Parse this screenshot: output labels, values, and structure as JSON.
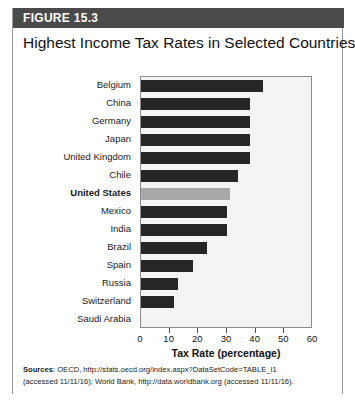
{
  "figure": {
    "label": "FIGURE 15.3",
    "title": "Highest Income Tax Rates in Selected Countries",
    "header_bg": "#4a4a4a",
    "bar_color": "#262626",
    "highlight_color": "#a8a8a8"
  },
  "source": {
    "lead": "Sources",
    "line1": ": OECD, http://stats.oecd.org/index.aspx?DataSetCode=TABLE_I1",
    "line2": "(accessed 11/11/16); World Bank, http://data.worldbank.org (accessed 11/11/16)."
  },
  "chart_data": {
    "type": "bar",
    "orientation": "horizontal",
    "title": "Highest Income Tax Rates in Selected Countries",
    "xlabel": "Tax Rate (percentage)",
    "ylabel": "",
    "xlim": [
      0,
      60
    ],
    "xticks": [
      0,
      10,
      20,
      30,
      40,
      50,
      60
    ],
    "grid": false,
    "legend": "none",
    "highlight_category": "United States",
    "categories": [
      "Belgium",
      "China",
      "Germany",
      "Japan",
      "United Kingdom",
      "Chile",
      "United States",
      "Mexico",
      "India",
      "Brazil",
      "Spain",
      "Russia",
      "Switzerland",
      "Saudi Arabia"
    ],
    "values": [
      42.5,
      38,
      38,
      38,
      38,
      34,
      31,
      30,
      30,
      23,
      18,
      13,
      11.5,
      0
    ]
  }
}
